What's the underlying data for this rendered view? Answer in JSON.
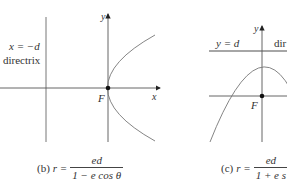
{
  "panels": [
    {
      "id": "b",
      "directrix_equation": "x = −d",
      "directrix_label": "directrix",
      "focus_label": "F",
      "y_axis_label": "y",
      "x_axis_label": "x",
      "caption_prefix": "(b)",
      "caption_lhs": "r =",
      "caption_numerator": "ed",
      "caption_denominator": "1 − e cos θ"
    },
    {
      "id": "c",
      "directrix_equation": "y = d",
      "directrix_label": "dir",
      "focus_label": "F",
      "y_axis_label": "y",
      "caption_prefix": "(c)",
      "caption_lhs": "r =",
      "caption_numerator": "ed",
      "caption_denominator": "1 + e s"
    }
  ],
  "colors": {
    "axis": "#555555",
    "curve": "#777777",
    "directrix_c": "#888888",
    "focus_dot": "#111111"
  }
}
